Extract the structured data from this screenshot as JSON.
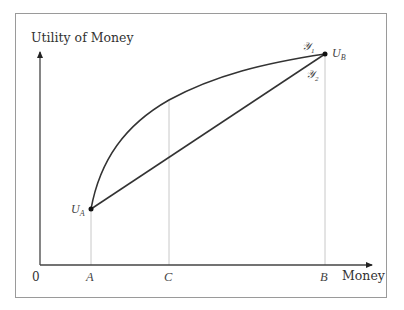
{
  "diagram": {
    "type": "utility-of-money",
    "y_axis_label": "Utility of Money",
    "x_axis_label": "Money",
    "origin_label": "0",
    "x_ticks": [
      {
        "label": "A",
        "x": 91
      },
      {
        "label": "C",
        "x": 169
      },
      {
        "label": "B",
        "x": 325
      }
    ],
    "points": {
      "ua": {
        "label": "U",
        "sub": "A",
        "x": 91,
        "y": 209
      },
      "ub": {
        "label": "U",
        "sub": "B",
        "x": 325,
        "y": 54
      }
    },
    "curves": {
      "concave": {
        "label": "𝒴",
        "sub": "1",
        "description": "concave utility curve from U_A to U_B"
      },
      "chord": {
        "label": "𝒴",
        "sub": "2",
        "description": "straight line from U_A to U_B"
      }
    },
    "colors": {
      "frame": "#9a9a9a",
      "axis": "#444444",
      "curve": "#333333",
      "guide": "#c8c8c8",
      "text": "#333333"
    }
  }
}
